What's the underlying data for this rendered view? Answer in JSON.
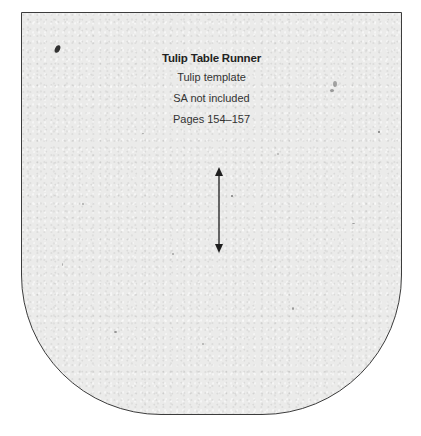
{
  "template": {
    "title": "Tulip Table Runner",
    "subtitle": "Tulip template",
    "seam_allowance_note": "SA not included",
    "pages": "Pages 154–157"
  },
  "grainline": {
    "direction": "vertical",
    "icon": "double-headed-arrow-icon"
  },
  "colors": {
    "paper": "#ebebea",
    "outline": "#3c3c3c",
    "text": "#222222",
    "background": "#ffffff"
  }
}
